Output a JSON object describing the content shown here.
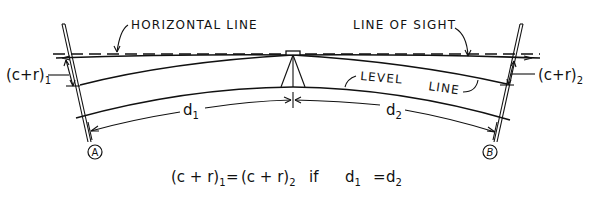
{
  "diagram": {
    "labels": {
      "horizontal_line": "HORIZONTAL LINE",
      "line_of_sight": "LINE OF SIGHT",
      "level": "LEVEL",
      "line": "LINE",
      "cr1_base": "(c+r)",
      "cr1_sub": "1",
      "cr2_base": "(c+r)",
      "cr2_sub": "2",
      "d1_base": "d",
      "d1_sub": "1",
      "d2_base": "d",
      "d2_sub": "2",
      "point_a": "A",
      "point_b": "B"
    },
    "equation": {
      "lhs_base": "(c + r)",
      "lhs_sub": "1",
      "equals1": "=",
      "rhs_base": "(c + r)",
      "rhs_sub": "2",
      "if": "if",
      "d1_base": "d",
      "d1_sub": "1",
      "equals2": "=",
      "d2_base": "d",
      "d2_sub": "2"
    }
  }
}
